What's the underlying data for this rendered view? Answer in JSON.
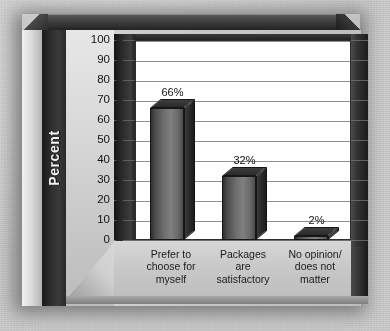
{
  "chart_data": {
    "type": "bar",
    "title": "",
    "xlabel": "",
    "ylabel": "Percent",
    "ylim": [
      0,
      100
    ],
    "ytick_step": 10,
    "grid": true,
    "legend": "none",
    "categories": [
      "Prefer to choose for myself",
      "Packages are satisfactory",
      "No opinion/ does not matter"
    ],
    "category_lines": [
      [
        "Prefer to",
        "choose for",
        "myself"
      ],
      [
        "Packages",
        "are",
        "satisfactory"
      ],
      [
        "No opinion/",
        "does not",
        "matter"
      ]
    ],
    "values": [
      66,
      32,
      2
    ],
    "value_labels": [
      "66%",
      "32%",
      "2%"
    ],
    "yticks": [
      "100",
      "90",
      "80",
      "70",
      "60",
      "50",
      "40",
      "30",
      "20",
      "10",
      "0"
    ],
    "colors": {
      "bar_front": "#808080",
      "bar_top": "#2f2f2f",
      "bar_side": "#262626",
      "plot_background": "#ffffff",
      "gridline": "#8f8f8f",
      "frame": "#2a2a2a",
      "axis_label_text": "#f2f2f2",
      "page_background": "#c9c9c9"
    }
  }
}
